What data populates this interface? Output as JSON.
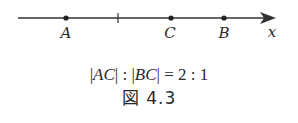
{
  "diagram": {
    "axis": {
      "label": "x",
      "color": "#333333"
    },
    "points": [
      {
        "label": "A",
        "x": 66
      },
      {
        "label": "C",
        "x": 171
      },
      {
        "label": "B",
        "x": 224
      }
    ],
    "tick_x": 118,
    "formula": {
      "ac": "AC",
      "bc": "BC",
      "ratio": "= 2 : 1"
    },
    "caption": "図 4.3"
  }
}
